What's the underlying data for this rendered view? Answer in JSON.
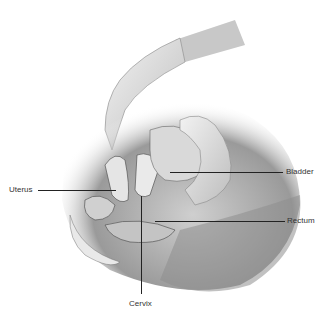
{
  "illustration": {
    "subject": "pelvic exam cross-section with gloved hand",
    "labels": [
      {
        "id": "uterus",
        "text": "Uterus"
      },
      {
        "id": "bladder",
        "text": "Bladder"
      },
      {
        "id": "rectum",
        "text": "Rectum"
      },
      {
        "id": "cervix",
        "text": "Cervix"
      }
    ]
  }
}
